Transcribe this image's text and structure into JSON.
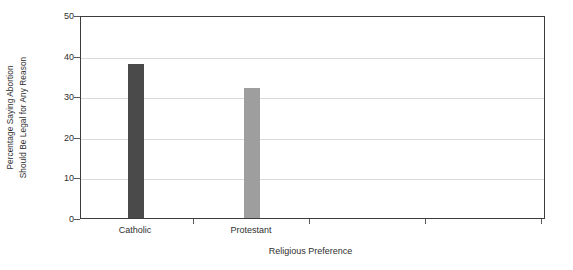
{
  "chart_data": {
    "type": "bar",
    "title": "",
    "subtitle": "",
    "categories": [
      "Catholic",
      "Protestant"
    ],
    "values": [
      38,
      32
    ],
    "series": [
      {
        "name": "Percentage Saying Abortion Should Be Legal for Any Reason",
        "values": [
          38,
          32
        ]
      }
    ],
    "xlabel": "Religious Preference",
    "ylabel_line1": "Percentage Saying Abortion",
    "ylabel_line2": "Should Be Legal for Any Reason",
    "ylabel": "Percentage Saying Abortion Should Be Legal for Any Reason",
    "ylim": [
      0,
      50
    ],
    "yticks": [
      0,
      10,
      20,
      30,
      40,
      50
    ],
    "ytick_labels": [
      "0",
      "10",
      "20",
      "30",
      "40",
      "50"
    ],
    "grid": "horizontal",
    "legend": "none",
    "bar_colors": [
      "#4a4a4a",
      "#9e9e9e"
    ],
    "plot_background": "#ffffff",
    "gridline_color": "#dadada",
    "axis_color": "#3c3c3c",
    "bar_width_px": 16,
    "bar_centers_px": [
      55,
      171
    ],
    "x_tick_positions_px": [
      113,
      229,
      345,
      461
    ]
  }
}
